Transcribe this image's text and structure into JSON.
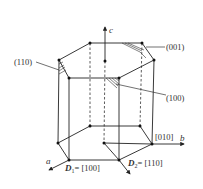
{
  "diagram": {
    "type": "crystal-hexagonal-prism",
    "colors": {
      "line": "#222222",
      "label": "#333333",
      "background": "#ffffff"
    },
    "axes": {
      "c": {
        "label": "c"
      },
      "b": {
        "label": "b",
        "direction_label": "[010]"
      },
      "a": {
        "label": "a"
      }
    },
    "directions": {
      "d1": {
        "symbol": "D",
        "subscript": "1",
        "value": "= [100]"
      },
      "d2": {
        "symbol": "D",
        "subscript": "2",
        "value": "= [110]"
      }
    },
    "planes": {
      "p001": "(001)",
      "p110": "(110)",
      "p100": "(100)"
    },
    "vertices": {
      "top": [
        [
          90,
          43
        ],
        [
          142,
          43
        ],
        [
          154,
          60
        ],
        [
          119,
          78
        ],
        [
          69,
          78
        ],
        [
          59,
          60
        ]
      ],
      "top_center": [
        105,
        61
      ],
      "bottom": [
        [
          90,
          126
        ],
        [
          140,
          126
        ],
        [
          152,
          144
        ],
        [
          119,
          160
        ],
        [
          69,
          160
        ],
        [
          58,
          143
        ]
      ],
      "bottom_center": [
        104,
        143
      ]
    }
  }
}
